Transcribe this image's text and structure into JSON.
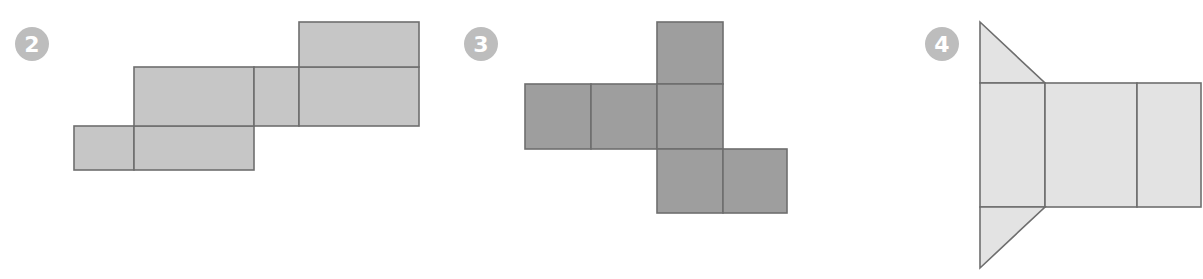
{
  "figure": {
    "nets": [
      {
        "number": "2",
        "label": "net-2",
        "solid": "rectangular prism",
        "face_count": 6,
        "face_color": "#c6c6c6",
        "faces": [
          {
            "shape": "rect",
            "pts": [
              [
                74,
                126
              ],
              [
                134,
                170
              ]
            ]
          },
          {
            "shape": "rect",
            "pts": [
              [
                134,
                126
              ],
              [
                254,
                170
              ]
            ]
          },
          {
            "shape": "rect",
            "pts": [
              [
                134,
                67
              ],
              [
                254,
                126
              ]
            ]
          },
          {
            "shape": "rect",
            "pts": [
              [
                254,
                67
              ],
              [
                299,
                126
              ]
            ]
          },
          {
            "shape": "rect",
            "pts": [
              [
                299,
                67
              ],
              [
                419,
                126
              ]
            ]
          },
          {
            "shape": "rect",
            "pts": [
              [
                299,
                22
              ],
              [
                419,
                67
              ]
            ]
          }
        ]
      },
      {
        "number": "3",
        "label": "net-3",
        "solid": "cube",
        "face_count": 6,
        "face_color": "#9e9e9e",
        "faces": [
          {
            "shape": "rect",
            "pts": [
              [
                657,
                22
              ],
              [
                723,
                84
              ]
            ]
          },
          {
            "shape": "rect",
            "pts": [
              [
                525,
                84
              ],
              [
                591,
                149
              ]
            ]
          },
          {
            "shape": "rect",
            "pts": [
              [
                591,
                84
              ],
              [
                657,
                149
              ]
            ]
          },
          {
            "shape": "rect",
            "pts": [
              [
                657,
                84
              ],
              [
                723,
                149
              ]
            ]
          },
          {
            "shape": "rect",
            "pts": [
              [
                657,
                149
              ],
              [
                723,
                213
              ]
            ]
          },
          {
            "shape": "rect",
            "pts": [
              [
                723,
                149
              ],
              [
                787,
                213
              ]
            ]
          }
        ]
      },
      {
        "number": "4",
        "label": "net-4",
        "solid": "triangular prism",
        "face_count": 5,
        "face_color": "#e3e3e3",
        "faces": [
          {
            "shape": "poly",
            "pts": [
              [
                980,
                22
              ],
              [
                1045,
                83
              ],
              [
                980,
                83
              ]
            ]
          },
          {
            "shape": "rect",
            "pts": [
              [
                980,
                83
              ],
              [
                1045,
                207
              ]
            ]
          },
          {
            "shape": "rect",
            "pts": [
              [
                1045,
                83
              ],
              [
                1137,
                207
              ]
            ]
          },
          {
            "shape": "rect",
            "pts": [
              [
                1137,
                83
              ],
              [
                1201,
                207
              ]
            ]
          },
          {
            "shape": "poly",
            "pts": [
              [
                980,
                207
              ],
              [
                1045,
                207
              ],
              [
                980,
                268
              ]
            ]
          }
        ]
      }
    ],
    "badges": [
      {
        "number": "2",
        "color": "#bdbdbd"
      },
      {
        "number": "3",
        "color": "#bdbdbd"
      },
      {
        "number": "4",
        "color": "#bdbdbd"
      }
    ],
    "stroke_color": "#6e6e6e"
  }
}
